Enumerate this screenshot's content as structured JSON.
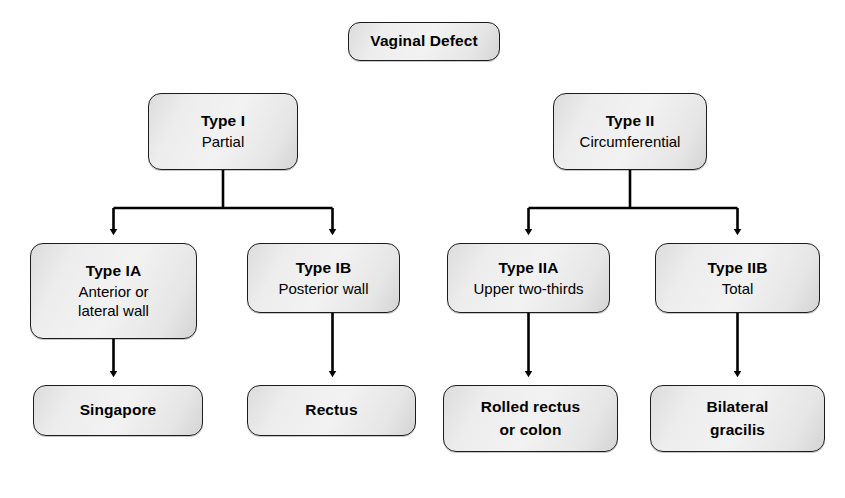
{
  "diagram": {
    "style": {
      "node_fill": "#ededed",
      "node_border": "#1c1c1c",
      "edge_color": "#000000",
      "background": "#ffffff"
    },
    "nodes": {
      "root": {
        "title": "Vaginal Defect"
      },
      "type1": {
        "title": "Type I",
        "subtitle": "Partial"
      },
      "type2": {
        "title": "Type II",
        "subtitle": "Circumferential"
      },
      "type1a": {
        "title": "Type IA",
        "subtitle_line1": "Anterior or",
        "subtitle_line2": "lateral wall"
      },
      "type1b": {
        "title": "Type IB",
        "subtitle": "Posterior wall"
      },
      "type2a": {
        "title": "Type IIA",
        "subtitle": "Upper two-thirds"
      },
      "type2b": {
        "title": "Type IIB",
        "subtitle": "Total"
      },
      "singapore": {
        "title": "Singapore"
      },
      "rectus": {
        "title": "Rectus"
      },
      "rolled": {
        "title_line1": "Rolled rectus",
        "title_line2": "or colon"
      },
      "bilateral": {
        "title_line1": "Bilateral",
        "title_line2": "gracilis"
      }
    },
    "edges": [
      {
        "from": "type1",
        "to": "type1a",
        "kind": "branch-arrow"
      },
      {
        "from": "type1",
        "to": "type1b",
        "kind": "branch-arrow"
      },
      {
        "from": "type2",
        "to": "type2a",
        "kind": "branch-arrow"
      },
      {
        "from": "type2",
        "to": "type2b",
        "kind": "branch-arrow"
      },
      {
        "from": "type1a",
        "to": "singapore",
        "kind": "straight-arrow"
      },
      {
        "from": "type1b",
        "to": "rectus",
        "kind": "straight-arrow"
      },
      {
        "from": "type2a",
        "to": "rolled",
        "kind": "straight-arrow"
      },
      {
        "from": "type2b",
        "to": "bilateral",
        "kind": "straight-arrow"
      }
    ]
  }
}
